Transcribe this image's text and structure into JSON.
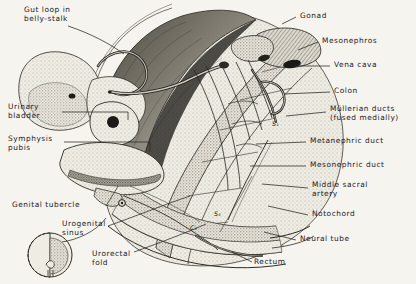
{
  "figure": {
    "background_color": "#f6f4ee",
    "ink_color": "#20201e"
  },
  "labels_left": [
    {
      "id": "gut-loop",
      "text": "Gut loop in\nbelly-stalk",
      "x": 24,
      "y": 6,
      "align": "left"
    },
    {
      "id": "urinary-bladder",
      "text": "Urinary\nbladder",
      "x": 8,
      "y": 103,
      "align": "left"
    },
    {
      "id": "symphysis-pubis",
      "text": "Symphysis\npubis",
      "x": 8,
      "y": 138,
      "align": "left"
    },
    {
      "id": "genital-tubercle",
      "text": "Genital tubercle",
      "x": 12,
      "y": 202,
      "align": "left"
    },
    {
      "id": "urogenital-sinus",
      "text": "Urogenital\nsinus",
      "x": 62,
      "y": 222,
      "align": "left"
    },
    {
      "id": "urorectal-fold",
      "text": "Urorectal\nfold",
      "x": 92,
      "y": 253,
      "align": "left"
    }
  ],
  "labels_right": [
    {
      "id": "gonad",
      "text": "Gonad",
      "x": 300,
      "y": 13
    },
    {
      "id": "mesonephros",
      "text": "Mesonephros",
      "x": 322,
      "y": 39
    },
    {
      "id": "vena-cava",
      "text": "Vena cava",
      "x": 334,
      "y": 63
    },
    {
      "id": "colon",
      "text": "Colon",
      "x": 334,
      "y": 89
    },
    {
      "id": "mullerian-ducts",
      "text": "Müllerian ducts\n(fused medially)",
      "x": 330,
      "y": 108
    },
    {
      "id": "metanephric-duct",
      "text": "Metanephric duct",
      "x": 310,
      "y": 139
    },
    {
      "id": "mesonephric-duct",
      "text": "Mesonephric duct",
      "x": 310,
      "y": 163
    },
    {
      "id": "middle-sacral-artery",
      "text": "Middle sacral\nartery",
      "x": 312,
      "y": 184
    },
    {
      "id": "notochord",
      "text": "Notochord",
      "x": 312,
      "y": 212
    },
    {
      "id": "neural-tube",
      "text": "Neural tube",
      "x": 300,
      "y": 237
    },
    {
      "id": "rectum",
      "text": "Rectum",
      "x": 254,
      "y": 260
    }
  ],
  "vertebra_markers": [
    {
      "id": "s1",
      "text": "S₁",
      "x": 272,
      "y": 122
    },
    {
      "id": "s5",
      "text": "S₅",
      "x": 214,
      "y": 212
    },
    {
      "id": "c1",
      "text": "C₁",
      "x": 190,
      "y": 226
    }
  ]
}
